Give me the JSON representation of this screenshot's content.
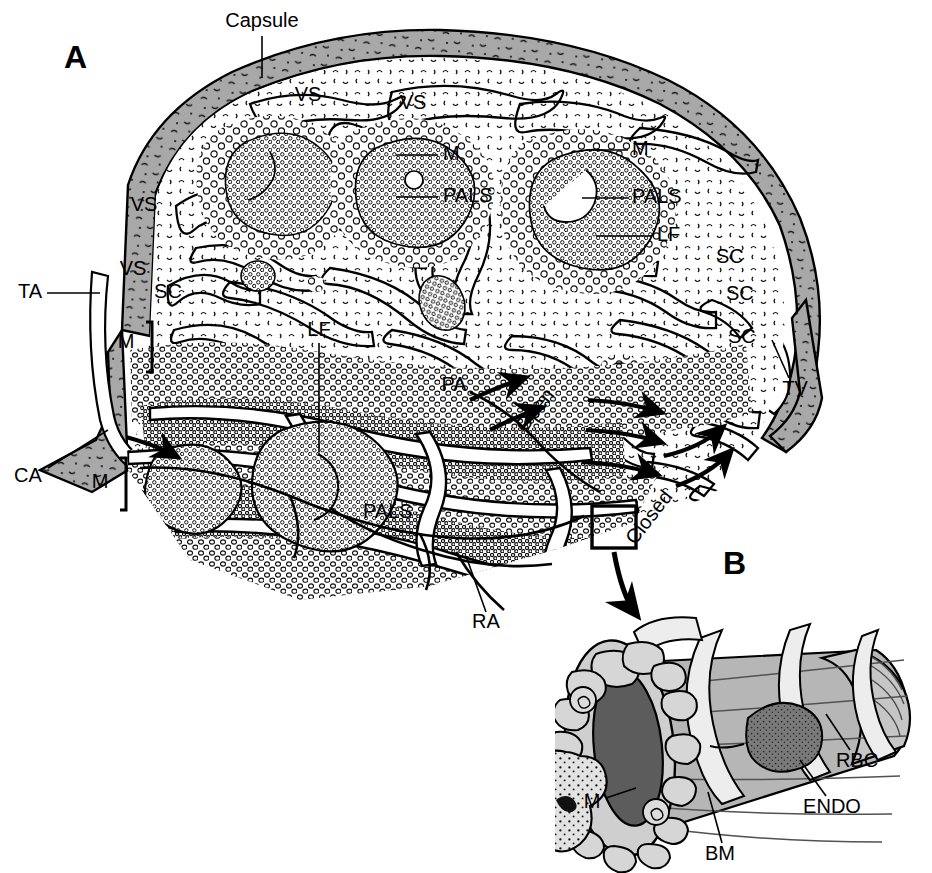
{
  "figure": {
    "panels": [
      {
        "id": "A",
        "label": "A",
        "caption": "Cross-section of splenic tissue"
      },
      {
        "id": "B",
        "label": "B",
        "caption": "Three-dimensional detail of a splenic sinusoid"
      }
    ]
  },
  "panel_a": {
    "label": "A",
    "labels": {
      "capsule": "Capsule",
      "ta": "TA",
      "ca": "CA",
      "ra": "RA",
      "pa": "PA",
      "tv": "TV",
      "lf": "LF",
      "pals": "PALS",
      "vs": "VS",
      "sc": "SC",
      "m": "M",
      "open": "Open",
      "closed": "Closed"
    },
    "callouts": [
      {
        "name": "capsule",
        "text": "Capsule",
        "x": 262,
        "y": 22,
        "anchor": "middle"
      },
      {
        "name": "vs-1",
        "text": "VS",
        "x": 308,
        "y": 96,
        "anchor": "middle"
      },
      {
        "name": "vs-2",
        "text": "VS",
        "x": 413,
        "y": 104,
        "anchor": "middle"
      },
      {
        "name": "vs-3",
        "text": "VS",
        "x": 144,
        "y": 206,
        "anchor": "middle"
      },
      {
        "name": "vs-4",
        "text": "VS",
        "x": 133,
        "y": 270,
        "anchor": "middle"
      },
      {
        "name": "m-top-1",
        "text": "M",
        "x": 443,
        "y": 155,
        "anchor": "start"
      },
      {
        "name": "m-top-2",
        "text": "M",
        "x": 632,
        "y": 150,
        "anchor": "start"
      },
      {
        "name": "pals-top-1",
        "text": "PALS",
        "x": 443,
        "y": 197,
        "anchor": "start"
      },
      {
        "name": "pals-top-2",
        "text": "PALS",
        "x": 632,
        "y": 198,
        "anchor": "start"
      },
      {
        "name": "lf-right",
        "text": "LF",
        "x": 657,
        "y": 236,
        "anchor": "start"
      },
      {
        "name": "sc-right-1",
        "text": "SC",
        "x": 716,
        "y": 258,
        "anchor": "start"
      },
      {
        "name": "sc-right-2",
        "text": "SC",
        "x": 726,
        "y": 295,
        "anchor": "start"
      },
      {
        "name": "sc-right-3",
        "text": "SC",
        "x": 728,
        "y": 338,
        "anchor": "start"
      },
      {
        "name": "sc-left",
        "text": "SC",
        "x": 168,
        "y": 293,
        "anchor": "middle"
      },
      {
        "name": "ta",
        "text": "TA",
        "x": 18,
        "y": 293,
        "anchor": "start"
      },
      {
        "name": "ca",
        "text": "CA",
        "x": 14,
        "y": 477,
        "anchor": "start"
      },
      {
        "name": "m-mid-left",
        "text": "M",
        "x": 126,
        "y": 343,
        "anchor": "middle"
      },
      {
        "name": "m-low-left",
        "text": "M",
        "x": 100,
        "y": 483,
        "anchor": "middle"
      },
      {
        "name": "lf-center",
        "text": "LF",
        "x": 319,
        "y": 331,
        "anchor": "middle"
      },
      {
        "name": "pals-bottom",
        "text": "PALS",
        "x": 363,
        "y": 513,
        "anchor": "start"
      },
      {
        "name": "ra",
        "text": "RA",
        "x": 486,
        "y": 623,
        "anchor": "middle"
      },
      {
        "name": "pa",
        "text": "PA",
        "x": 454,
        "y": 386,
        "anchor": "middle"
      },
      {
        "name": "tv",
        "text": "TV",
        "x": 795,
        "y": 390,
        "anchor": "middle"
      },
      {
        "name": "open",
        "text": "Open",
        "x": 536,
        "y": 411,
        "anchor": "middle",
        "rotate": -52
      },
      {
        "name": "closed",
        "text": "Closed",
        "x": 650,
        "y": 518,
        "anchor": "middle",
        "rotate": -52
      }
    ]
  },
  "panel_b": {
    "label": "B",
    "labels": {
      "m": "M",
      "bm": "BM",
      "endo": "ENDO",
      "rbc": "RBC"
    },
    "callouts": [
      {
        "name": "m",
        "text": "M",
        "x": 592,
        "y": 803,
        "anchor": "middle"
      },
      {
        "name": "bm",
        "text": "BM",
        "x": 720,
        "y": 855,
        "anchor": "middle"
      },
      {
        "name": "endo",
        "text": "ENDO",
        "x": 832,
        "y": 808,
        "anchor": "middle"
      },
      {
        "name": "rbc",
        "text": "RBC",
        "x": 857,
        "y": 762,
        "anchor": "middle"
      }
    ]
  },
  "colors": {
    "capsule_gray": "#a8a8a8",
    "ink": "#000000",
    "background": "#ffffff",
    "red_pulp_fill": "#ffffff",
    "sinusoid_light": "#d2d2d2",
    "sinusoid_mid": "#b4b4b4",
    "sinusoid_dark": "#5c5c5c",
    "sinusoid_band": "#ececec",
    "rbc_gray": "#787878"
  }
}
